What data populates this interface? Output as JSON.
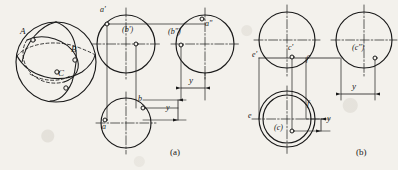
{
  "figure": {
    "title_present": false,
    "background_color": "#f3f1ec",
    "ink_color": "#1a1a1a",
    "captions": [
      {
        "text": "(a)",
        "x": 172,
        "y": 152
      },
      {
        "text": "(b)",
        "x": 358,
        "y": 152
      }
    ]
  },
  "pictorial": {
    "name": "sphere-pictorial",
    "center_x": 56,
    "center_y": 62,
    "radius": 40,
    "points": [
      {
        "label": "A",
        "x": 26,
        "y": 34,
        "px": 33,
        "py": 40
      },
      {
        "label": "B",
        "x": 76,
        "y": 52,
        "px": 75,
        "py": 60
      },
      {
        "label": "C",
        "x": 62,
        "y": 76,
        "px": 57,
        "py": 72
      }
    ],
    "extra_marker": {
      "x": 66,
      "y": 88
    }
  },
  "diagram_a": {
    "name": "projection-diagram-a",
    "front_view": {
      "cx": 126,
      "cy": 44,
      "r": 29,
      "points": [
        {
          "label": "a'",
          "lx": 101,
          "ly": 10,
          "px": 107,
          "py": 24
        },
        {
          "label": "(b')",
          "lx": 124,
          "ly": 30,
          "px": 136,
          "py": 44
        }
      ]
    },
    "side_view": {
      "cx": 205,
      "cy": 44,
      "r": 29,
      "points": [
        {
          "label": "a\"",
          "lx": 206,
          "ly": 24,
          "px": 202,
          "py": 19
        },
        {
          "label": "(b\")",
          "lx": 172,
          "ly": 32,
          "px": 181,
          "py": 45
        }
      ]
    },
    "top_view": {
      "cx": 126,
      "cy": 123,
      "r": 25,
      "points": [
        {
          "label": "a",
          "lx": 104,
          "ly": 131,
          "px": 105,
          "py": 120
        },
        {
          "label": "b",
          "lx": 140,
          "ly": 100,
          "px": 143,
          "py": 108
        }
      ]
    },
    "dim_vertical": {
      "label": "y",
      "x": 160,
      "y": 116
    },
    "dim_horizontal": {
      "label": "y",
      "x": 190,
      "y": 82
    }
  },
  "diagram_b": {
    "name": "projection-diagram-b",
    "front_view": {
      "cx": 287,
      "cy": 40,
      "r": 28,
      "points": [
        {
          "label": "c'",
          "lx": 290,
          "ly": 47,
          "px": 292,
          "py": 57
        },
        {
          "label": "e'",
          "lx": 258,
          "ly": 57,
          "px": 260,
          "py": 58
        },
        {
          "label": "f'",
          "lx": 307,
          "ly": 60,
          "px": 306,
          "py": 58
        }
      ]
    },
    "side_view": {
      "cx": 364,
      "cy": 40,
      "r": 28,
      "points": [
        {
          "label": "(c\")",
          "lx": 358,
          "ly": 47,
          "px": 375,
          "py": 58
        }
      ]
    },
    "top_view": {
      "cx": 287,
      "cy": 119,
      "r_outer": 28,
      "r_inner": 24,
      "points": [
        {
          "label": "e",
          "lx": 252,
          "ly": 117,
          "px": 259,
          "py": 119
        },
        {
          "label": "f",
          "lx": 308,
          "ly": 105,
          "px": 312,
          "py": 119
        },
        {
          "label": "(c)",
          "lx": 278,
          "ly": 128,
          "px": 292,
          "py": 131
        }
      ]
    },
    "dim_vertical": {
      "label": "y",
      "x": 321,
      "y": 124
    },
    "dim_horizontal": {
      "label": "y",
      "x": 348,
      "y": 88
    }
  }
}
